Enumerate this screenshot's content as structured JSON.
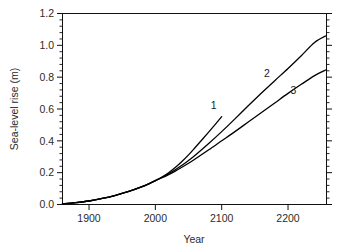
{
  "chart_data": {
    "type": "line",
    "title": "",
    "xlabel": "Year",
    "ylabel": "Sea-level rise (m)",
    "xlim": [
      1860,
      2258
    ],
    "ylim": [
      0.0,
      1.2
    ],
    "grid": false,
    "legend_position": "inline-end-labels",
    "xticks": [
      1900,
      2000,
      2100,
      2200
    ],
    "xticklabels": [
      "1900",
      "2000",
      "2100",
      "2200"
    ],
    "yticks": [
      0.0,
      0.2,
      0.4,
      0.6,
      0.8,
      1.0,
      1.2
    ],
    "yticklabels": [
      "0.0",
      "0.2",
      "0.4",
      "0.6",
      "0.8",
      "1.0",
      "1.2"
    ],
    "y_minor_ticks_per_interval": 4,
    "series": [
      {
        "name": "1",
        "label": "1",
        "label_x": 2088,
        "label_y": 0.6,
        "x": [
          1860,
          1880,
          1900,
          1920,
          1940,
          1960,
          1980,
          1990,
          2000,
          2010,
          2020,
          2030,
          2040,
          2050,
          2060,
          2070,
          2080,
          2090,
          2100
        ],
        "y": [
          0.005,
          0.012,
          0.022,
          0.038,
          0.058,
          0.082,
          0.112,
          0.13,
          0.15,
          0.173,
          0.2,
          0.232,
          0.27,
          0.312,
          0.358,
          0.405,
          0.453,
          0.502,
          0.552
        ]
      },
      {
        "name": "2",
        "label": "2",
        "label_x": 2168,
        "label_y": 0.8,
        "x": [
          1860,
          1880,
          1900,
          1920,
          1940,
          1960,
          1980,
          1990,
          2000,
          2010,
          2020,
          2030,
          2040,
          2050,
          2060,
          2080,
          2100,
          2120,
          2140,
          2160,
          2180,
          2200,
          2220,
          2240,
          2258
        ],
        "y": [
          0.005,
          0.012,
          0.022,
          0.038,
          0.058,
          0.082,
          0.112,
          0.13,
          0.15,
          0.17,
          0.193,
          0.218,
          0.246,
          0.277,
          0.31,
          0.382,
          0.458,
          0.538,
          0.62,
          0.7,
          0.778,
          0.855,
          0.935,
          1.018,
          1.062
        ]
      },
      {
        "name": "3",
        "label": "3",
        "label_x": 2208,
        "label_y": 0.695,
        "x": [
          1860,
          1880,
          1900,
          1920,
          1940,
          1960,
          1980,
          1990,
          2000,
          2010,
          2020,
          2030,
          2040,
          2050,
          2060,
          2080,
          2100,
          2120,
          2140,
          2160,
          2180,
          2200,
          2220,
          2240,
          2258
        ],
        "y": [
          0.005,
          0.012,
          0.022,
          0.038,
          0.058,
          0.082,
          0.112,
          0.13,
          0.15,
          0.168,
          0.188,
          0.21,
          0.234,
          0.259,
          0.286,
          0.342,
          0.4,
          0.458,
          0.518,
          0.578,
          0.638,
          0.698,
          0.755,
          0.81,
          0.848
        ]
      }
    ],
    "colors": {
      "curve": "#000000",
      "axis": "#111111",
      "text": "#2b2b2b",
      "background": "#ffffff"
    }
  }
}
